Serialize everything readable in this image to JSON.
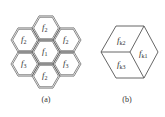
{
  "figure_a": {
    "caption": "(a)",
    "cells": [
      {
        "id": "top",
        "cx": 46,
        "cy": 28,
        "base": "f",
        "sub": "2"
      },
      {
        "id": "upper-left",
        "cx": 25,
        "cy": 40,
        "base": "f",
        "sub": "2"
      },
      {
        "id": "upper-right",
        "cx": 67,
        "cy": 40,
        "base": "f",
        "sub": "2"
      },
      {
        "id": "center",
        "cx": 46,
        "cy": 52,
        "base": "f",
        "sub": "1"
      },
      {
        "id": "lower-left",
        "cx": 25,
        "cy": 64,
        "base": "f",
        "sub": "3"
      },
      {
        "id": "lower-right",
        "cx": 67,
        "cy": 64,
        "base": "f",
        "sub": "3"
      },
      {
        "id": "bottom",
        "cx": 46,
        "cy": 76,
        "base": "f",
        "sub": "2"
      }
    ]
  },
  "figure_b": {
    "caption": "(b)",
    "faces": [
      {
        "id": "top-face",
        "base": "f",
        "sub": "k2"
      },
      {
        "id": "right-face",
        "base": "f",
        "sub": "k1"
      },
      {
        "id": "left-face",
        "base": "f",
        "sub": "k3"
      }
    ]
  },
  "colors": {
    "stroke": "#555555",
    "text": "#333333",
    "background": "#ffffff"
  }
}
